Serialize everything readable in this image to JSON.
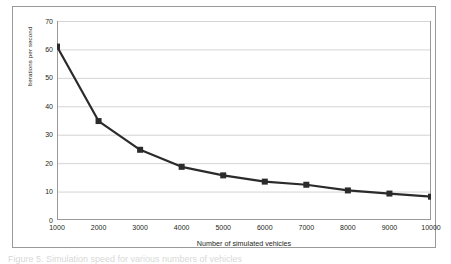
{
  "figure": {
    "caption": "Figure 5. Simulation speed for various numbers of vehicles"
  },
  "chart_data": {
    "type": "line",
    "title": "",
    "xlabel": "Number of simulated vehicles",
    "ylabel": "Iterations per second",
    "x": [
      1000,
      2000,
      3000,
      4000,
      5000,
      6000,
      7000,
      8000,
      9000,
      10000
    ],
    "values": [
      61,
      34.8,
      24.7,
      18.7,
      15.7,
      13.5,
      12.4,
      10.4,
      9.3,
      8.2
    ],
    "series": [
      {
        "name": "Iterations per second",
        "values": [
          61,
          34.8,
          24.7,
          18.7,
          15.7,
          13.5,
          12.4,
          10.4,
          9.3,
          8.2
        ]
      }
    ],
    "xlim": [
      1000,
      10000
    ],
    "ylim": [
      0,
      70
    ],
    "x_ticks": [
      "1000",
      "2000",
      "3000",
      "4000",
      "5000",
      "6000",
      "7000",
      "8000",
      "9000",
      "10000"
    ],
    "y_ticks": [
      "0",
      "10",
      "20",
      "30",
      "40",
      "50",
      "60",
      "70"
    ],
    "grid": "horizontal",
    "legend": "none",
    "line_color": "#2b2b2b",
    "marker": "square",
    "marker_color": "#2b2b2b",
    "grid_color": "#d4d4d4",
    "axis_color": "#9a9a9a",
    "plot_background": "#ffffff"
  }
}
